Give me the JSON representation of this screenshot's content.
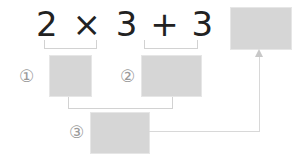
{
  "equation": {
    "tokens": [
      "2",
      "×",
      "3",
      "+",
      "3",
      "×",
      "4",
      "="
    ],
    "text": "2 × 3 + 3 × 4 ="
  },
  "answer_box": {
    "label": "",
    "value": ""
  },
  "steps": [
    {
      "marker": "①",
      "expression": "2 × 3",
      "value": ""
    },
    {
      "marker": "②",
      "expression": "3 × 4",
      "value": ""
    },
    {
      "marker": "③",
      "expression": "① + ②",
      "value": ""
    }
  ],
  "colors": {
    "box_fill": "#d6d6d6",
    "line": "#d8d8d8",
    "text": "#222222",
    "marker": "#9a9a9a"
  }
}
